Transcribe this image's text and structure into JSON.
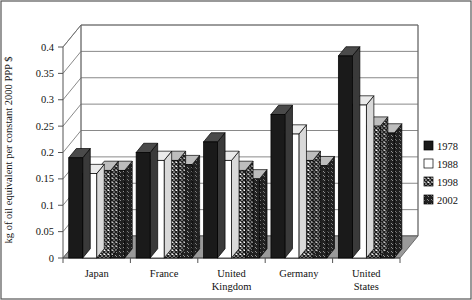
{
  "chart_data": {
    "type": "bar",
    "title": "",
    "subtitle": "",
    "xlabel": "",
    "ylabel": "kg of oil equivalent per constant 2000 PPP $",
    "categories": [
      "Japan",
      "France",
      "United Kingdom",
      "Germany",
      "United States"
    ],
    "category_lines": [
      [
        "Japan"
      ],
      [
        "France"
      ],
      [
        "United",
        "Kingdom"
      ],
      [
        "Germany"
      ],
      [
        "United",
        "States"
      ]
    ],
    "series": [
      {
        "name": "1978",
        "fill": "solid-black",
        "color": "#1a1a1a",
        "values": [
          0.19,
          0.2,
          0.22,
          0.272,
          0.383
        ]
      },
      {
        "name": "1988",
        "fill": "solid-white",
        "color": "#ffffff",
        "values": [
          0.16,
          0.185,
          0.185,
          0.235,
          0.29
        ]
      },
      {
        "name": "1998",
        "fill": "crosshatch",
        "color": "#4d4d4d",
        "values": [
          0.166,
          0.185,
          0.166,
          0.185,
          0.25
        ]
      },
      {
        "name": "2002",
        "fill": "diagonal",
        "color": "#5a5a5a",
        "values": [
          0.166,
          0.177,
          0.15,
          0.175,
          0.237
        ]
      }
    ],
    "ylim": [
      0,
      0.4
    ],
    "yticks": [
      0,
      0.05,
      0.1,
      0.15,
      0.2,
      0.25,
      0.3,
      0.35,
      0.4
    ],
    "ytick_labels": [
      "0",
      "0.05",
      "0.1",
      "0.15",
      "0.2",
      "0.25",
      "0.3",
      "0.35",
      "0.4"
    ],
    "grid": true,
    "grid_axis": "y",
    "legend_position": "right",
    "legend_entries": [
      "1978",
      "1988",
      "1998",
      "2002"
    ],
    "style": "3d-clustered-column",
    "border": true
  },
  "colors": {
    "plot_background": "#ffffff",
    "floor": "#9a9a9a",
    "gridline": "#6b6b6b",
    "axis": "#555555",
    "text": "#111111",
    "series_1978": "#1a1a1a",
    "series_1988": "#ffffff",
    "series_1998": "#4d4d4d",
    "series_2002": "#5a5a5a"
  }
}
